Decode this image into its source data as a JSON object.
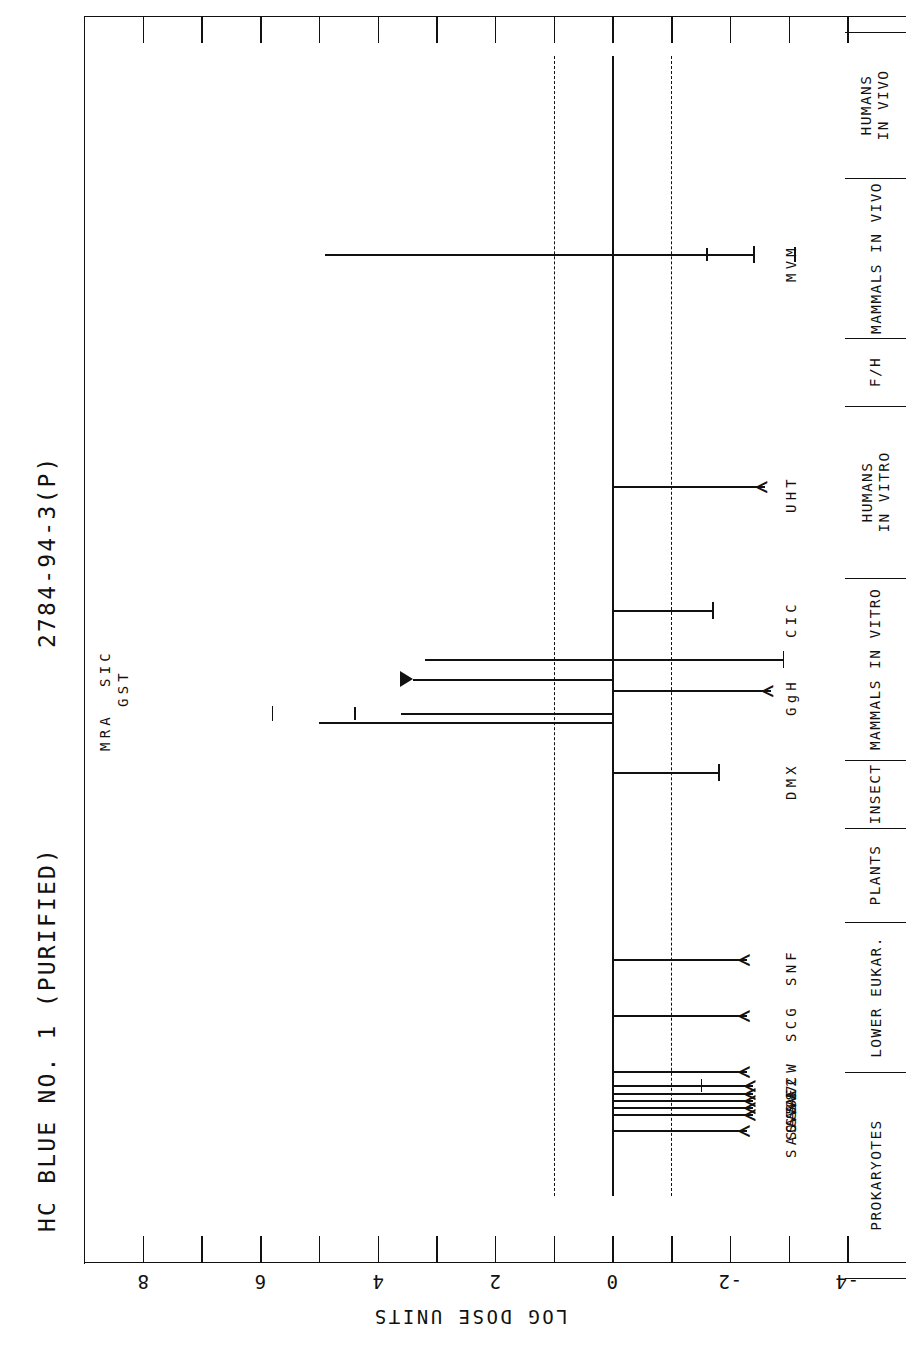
{
  "titles": {
    "main": "HC BLUE NO. 1 (PURIFIED)",
    "cas": "2784-94-3(P)"
  },
  "axis": {
    "label": "LOG DOSE UNITS",
    "tick_labels": [
      "8",
      "6",
      "4",
      "2",
      "0",
      "-2",
      "-4"
    ],
    "min": -5,
    "max": 9
  },
  "categories": [
    {
      "label": "PROKARYOTES",
      "lines": [
        "PROKARYOTES"
      ]
    },
    {
      "label": "LOWER EUKAR.",
      "lines": [
        "LOWER EUKAR."
      ]
    },
    {
      "label": "PLANTS",
      "lines": [
        "PLANTS"
      ]
    },
    {
      "label": "INSECT",
      "lines": [
        "INSECT"
      ]
    },
    {
      "label": "MAMMALS IN VITRO",
      "lines": [
        "MAMMALS IN VITRO"
      ]
    },
    {
      "label": "HUMANS IN VITRO",
      "lines": [
        "HUMANS",
        "IN VITRO"
      ]
    },
    {
      "label": "F/H",
      "lines": [
        "F/H"
      ]
    },
    {
      "label": "MAMMALS IN VIVO",
      "lines": [
        "MAMMALS IN VIVO"
      ]
    },
    {
      "label": "HUMANS IN VIVO",
      "lines": [
        "HUMANS",
        "IN VIVO"
      ]
    }
  ],
  "row_codes": {
    "prokaryotes": [
      "SAO",
      "SA5",
      "SA9",
      "SA8",
      "SA7",
      "SA2",
      "ECW"
    ],
    "lower_eukar": [
      "SCG",
      "SNF"
    ],
    "insect": [
      "DMX"
    ],
    "mammals_in_vitro_right": [
      "GgH",
      "CIC"
    ],
    "mammals_in_vitro_left": [
      "MRA",
      "GST",
      "SIC"
    ],
    "humans_in_vitro": [
      "UHT"
    ],
    "mammals_in_vivo": [
      "MVM"
    ]
  },
  "chart_data": {
    "type": "bar",
    "title": "HC BLUE NO. 1 (PURIFIED)",
    "subtitle": "2784-94-3(P)",
    "xlabel": "LOG DOSE UNITS",
    "ylabel": "",
    "xlim": [
      -5,
      9
    ],
    "xticks": [
      8,
      7,
      6,
      5,
      4,
      3,
      2,
      1,
      0,
      -1,
      -2,
      -3,
      -4
    ],
    "xtick_labels": [
      "8",
      "",
      "6",
      "",
      "4",
      "",
      "2",
      "",
      "0",
      "",
      "-2",
      "",
      "-4"
    ],
    "grid": false,
    "reference_lines": [
      {
        "value": 0,
        "style": "solid"
      },
      {
        "value": 1,
        "style": "dashed"
      },
      {
        "value": -1,
        "style": "dashed"
      }
    ],
    "orientation": "horizontal-bars",
    "series": [
      {
        "name": "MVM",
        "category": "MAMMALS IN VIVO",
        "low": 4.9,
        "high": -2.4,
        "lel": -1.6,
        "marker": "cap",
        "extra_tick": -3.1,
        "dash_from": 0,
        "dash_to": 4.9
      },
      {
        "name": "UHT",
        "category": "HUMANS IN VITRO",
        "low": 0.0,
        "high": -2.6,
        "marker": "chevron"
      },
      {
        "name": "CIC",
        "category": "MAMMALS IN VITRO",
        "low": 0.0,
        "high": -1.7,
        "marker": "cap"
      },
      {
        "name": "SIC",
        "category": "MAMMALS IN VITRO",
        "low": 3.2,
        "high": -2.9,
        "marker": "cap",
        "dash_from": 0,
        "dash_to": -2.9
      },
      {
        "name": "GST",
        "category": "MAMMALS IN VITRO",
        "low": 3.4,
        "high": 0.0,
        "marker": "arrow-left"
      },
      {
        "name": "GgH",
        "category": "MAMMALS IN VITRO",
        "low": 0.0,
        "high": -2.7,
        "marker": "chevron"
      },
      {
        "name": "MRA",
        "category": "MAMMALS IN VITRO",
        "low": 3.6,
        "high": 0.0,
        "marker": "cap",
        "extra_tick": 4.4,
        "stray_tick": 5.8
      },
      {
        "name": "MRA2",
        "category": "MAMMALS IN VITRO",
        "low": 5.0,
        "high": 0.0,
        "marker": "cap"
      },
      {
        "name": "DMX",
        "category": "INSECT",
        "low": 0.0,
        "high": -1.8,
        "marker": "cap"
      },
      {
        "name": "SNF",
        "category": "LOWER EUKAR.",
        "low": 0.0,
        "high": -2.3,
        "marker": "chevron"
      },
      {
        "name": "SCG",
        "category": "LOWER EUKAR.",
        "low": 0.0,
        "high": -2.3,
        "marker": "chevron"
      },
      {
        "name": "ECW",
        "category": "PROKARYOTES",
        "low": 0.0,
        "high": -2.3,
        "marker": "chevron"
      },
      {
        "name": "SA2",
        "category": "PROKARYOTES",
        "low": 0.0,
        "high": -2.4,
        "marker": "chevron",
        "extra_tick": -1.5
      },
      {
        "name": "SA7",
        "category": "PROKARYOTES",
        "low": 0.0,
        "high": -2.4,
        "marker": "chevron"
      },
      {
        "name": "SA8",
        "category": "PROKARYOTES",
        "low": 0.0,
        "high": -2.4,
        "marker": "chevron"
      },
      {
        "name": "SA9",
        "category": "PROKARYOTES",
        "low": 0.0,
        "high": -2.4,
        "marker": "chevron"
      },
      {
        "name": "SA5",
        "category": "PROKARYOTES",
        "low": 0.0,
        "high": -2.4,
        "marker": "chevron"
      },
      {
        "name": "SAO",
        "category": "PROKARYOTES",
        "low": 0.0,
        "high": -2.3,
        "marker": "chevron"
      }
    ]
  }
}
